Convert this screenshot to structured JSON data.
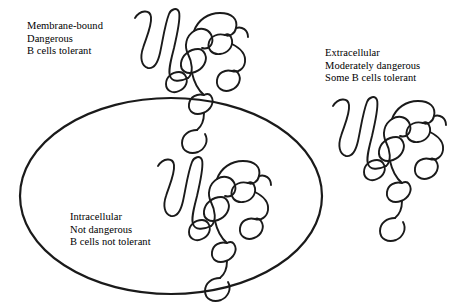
{
  "figure": {
    "background_color": "#ffffff",
    "ink_color": "#1a1a1a",
    "membrane": {
      "name": "cell-membrane",
      "shape": "ellipse",
      "center_x": 171,
      "center_y": 196,
      "radius_x": 151,
      "radius_y": 98,
      "stroke_width": 2.2
    }
  },
  "labels": {
    "membrane_bound": {
      "lines": [
        "Membrane-bound",
        "Dangerous",
        "B cells tolerant"
      ]
    },
    "extracellular": {
      "lines": [
        "Extracellular",
        "Moderately dangerous",
        "Some B cells tolerant"
      ]
    },
    "intracellular": {
      "lines": [
        "Intracellular",
        "Not dangerous",
        "B cells not tolerant"
      ]
    }
  },
  "molecules": [
    {
      "name": "antigen-membrane-bound",
      "location": "membrane-bound",
      "x": 132,
      "y": 4,
      "scale": 1.0
    },
    {
      "name": "antigen-extracellular",
      "location": "extracellular",
      "x": 330,
      "y": 92,
      "scale": 1.0
    },
    {
      "name": "antigen-intracellular",
      "location": "intracellular",
      "x": 155,
      "y": 152,
      "scale": 1.0
    }
  ]
}
